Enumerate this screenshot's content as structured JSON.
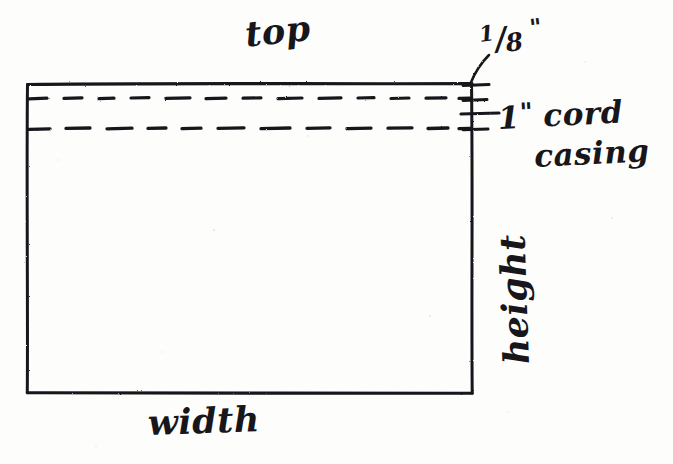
{
  "diagram": {
    "medium": "hand-drawn pencil sketch on white paper",
    "ink_color": "#17161a",
    "paper_color": "#fdfdfc",
    "panel": {
      "name": "fabric-panel",
      "shape": "rectangle",
      "left": 27,
      "top": 84,
      "right": 472,
      "bottom": 393
    },
    "labels": {
      "top": "top",
      "width": "width",
      "height": "height",
      "eighth_numerator": "1",
      "eighth_slash": "/",
      "eighth_denominator": "8",
      "eighth_unit": "\"",
      "casing_line1_value": "1",
      "casing_line1_unit": "\"",
      "casing_line1_word": " cord",
      "casing_line2": "casing"
    },
    "stitch_lines": [
      {
        "name": "casing-stitch-upper",
        "y": 98,
        "style": "dashed"
      },
      {
        "name": "casing-stitch-lower",
        "y": 128,
        "style": "dashed"
      }
    ],
    "dimensions": [
      {
        "name": "seam-allowance",
        "value": "1/8\"",
        "points_to": "top-right-corner"
      },
      {
        "name": "cord-casing-width",
        "value": "1\"",
        "points_to": "between-stitch-lines"
      }
    ]
  }
}
